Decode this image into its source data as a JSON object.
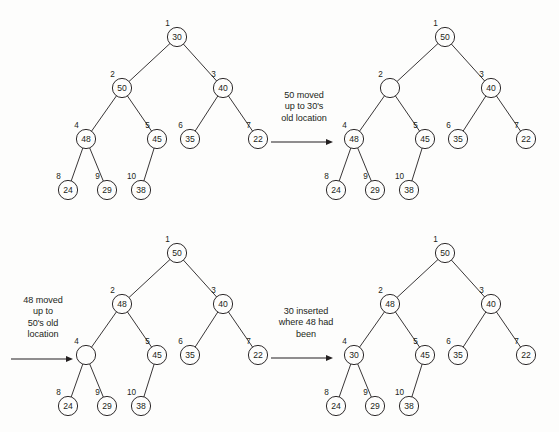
{
  "figure": {
    "background_color": "#fdfdfc",
    "ink_color": "#231f20"
  },
  "panels": [
    {
      "id": "panel-1",
      "name": "tree-before",
      "origin": {
        "x": 0,
        "y": 0
      },
      "nodes": [
        {
          "index": "1",
          "value": "30",
          "x": 177,
          "y": 37,
          "empty": false
        },
        {
          "index": "2",
          "value": "50",
          "x": 122,
          "y": 88,
          "empty": false
        },
        {
          "index": "3",
          "value": "40",
          "x": 223,
          "y": 88,
          "empty": false
        },
        {
          "index": "4",
          "value": "48",
          "x": 86,
          "y": 139,
          "empty": false
        },
        {
          "index": "5",
          "value": "45",
          "x": 157,
          "y": 139,
          "empty": false
        },
        {
          "index": "6",
          "value": "35",
          "x": 190,
          "y": 139,
          "empty": false
        },
        {
          "index": "7",
          "value": "22",
          "x": 258,
          "y": 139,
          "empty": false
        },
        {
          "index": "8",
          "value": "24",
          "x": 68,
          "y": 190,
          "empty": false
        },
        {
          "index": "9",
          "value": "29",
          "x": 107,
          "y": 190,
          "empty": false
        },
        {
          "index": "10",
          "value": "38",
          "x": 141,
          "y": 190,
          "empty": false
        }
      ],
      "edges": [
        [
          "1",
          "2"
        ],
        [
          "1",
          "3"
        ],
        [
          "2",
          "4"
        ],
        [
          "2",
          "5"
        ],
        [
          "3",
          "6"
        ],
        [
          "3",
          "7"
        ],
        [
          "4",
          "8"
        ],
        [
          "4",
          "9"
        ],
        [
          "5",
          "10"
        ]
      ]
    },
    {
      "id": "panel-2",
      "name": "tree-after-50-moved",
      "origin": {
        "x": 268,
        "y": 0
      },
      "nodes": [
        {
          "index": "1",
          "value": "50",
          "x": 445,
          "y": 37,
          "empty": false
        },
        {
          "index": "2",
          "value": "",
          "x": 390,
          "y": 88,
          "empty": true
        },
        {
          "index": "3",
          "value": "40",
          "x": 491,
          "y": 88,
          "empty": false
        },
        {
          "index": "4",
          "value": "48",
          "x": 354,
          "y": 139,
          "empty": false
        },
        {
          "index": "5",
          "value": "45",
          "x": 425,
          "y": 139,
          "empty": false
        },
        {
          "index": "6",
          "value": "35",
          "x": 458,
          "y": 139,
          "empty": false
        },
        {
          "index": "7",
          "value": "22",
          "x": 526,
          "y": 139,
          "empty": false
        },
        {
          "index": "8",
          "value": "24",
          "x": 336,
          "y": 190,
          "empty": false
        },
        {
          "index": "9",
          "value": "29",
          "x": 375,
          "y": 190,
          "empty": false
        },
        {
          "index": "10",
          "value": "38",
          "x": 409,
          "y": 190,
          "empty": false
        }
      ],
      "edges": [
        [
          "1",
          "2"
        ],
        [
          "1",
          "3"
        ],
        [
          "2",
          "4"
        ],
        [
          "2",
          "5"
        ],
        [
          "3",
          "6"
        ],
        [
          "3",
          "7"
        ],
        [
          "4",
          "8"
        ],
        [
          "4",
          "9"
        ],
        [
          "5",
          "10"
        ]
      ]
    },
    {
      "id": "panel-3",
      "name": "tree-after-48-moved",
      "origin": {
        "x": 0,
        "y": 216
      },
      "nodes": [
        {
          "index": "1",
          "value": "50",
          "x": 177,
          "y": 253,
          "empty": false
        },
        {
          "index": "2",
          "value": "48",
          "x": 122,
          "y": 304,
          "empty": false
        },
        {
          "index": "3",
          "value": "40",
          "x": 223,
          "y": 304,
          "empty": false
        },
        {
          "index": "4",
          "value": "",
          "x": 86,
          "y": 355,
          "empty": true
        },
        {
          "index": "5",
          "value": "45",
          "x": 157,
          "y": 355,
          "empty": false
        },
        {
          "index": "6",
          "value": "35",
          "x": 190,
          "y": 355,
          "empty": false
        },
        {
          "index": "7",
          "value": "22",
          "x": 258,
          "y": 355,
          "empty": false
        },
        {
          "index": "8",
          "value": "24",
          "x": 68,
          "y": 406,
          "empty": false
        },
        {
          "index": "9",
          "value": "29",
          "x": 107,
          "y": 406,
          "empty": false
        },
        {
          "index": "10",
          "value": "38",
          "x": 141,
          "y": 406,
          "empty": false
        }
      ],
      "edges": [
        [
          "1",
          "2"
        ],
        [
          "1",
          "3"
        ],
        [
          "2",
          "4"
        ],
        [
          "2",
          "5"
        ],
        [
          "3",
          "6"
        ],
        [
          "3",
          "7"
        ],
        [
          "4",
          "8"
        ],
        [
          "4",
          "9"
        ],
        [
          "5",
          "10"
        ]
      ]
    },
    {
      "id": "panel-4",
      "name": "tree-after-30-inserted",
      "origin": {
        "x": 268,
        "y": 216
      },
      "nodes": [
        {
          "index": "1",
          "value": "50",
          "x": 445,
          "y": 253,
          "empty": false
        },
        {
          "index": "2",
          "value": "48",
          "x": 390,
          "y": 304,
          "empty": false
        },
        {
          "index": "3",
          "value": "40",
          "x": 491,
          "y": 304,
          "empty": false
        },
        {
          "index": "4",
          "value": "30",
          "x": 354,
          "y": 355,
          "empty": false
        },
        {
          "index": "5",
          "value": "45",
          "x": 425,
          "y": 355,
          "empty": false
        },
        {
          "index": "6",
          "value": "35",
          "x": 458,
          "y": 355,
          "empty": false
        },
        {
          "index": "7",
          "value": "22",
          "x": 526,
          "y": 355,
          "empty": false
        },
        {
          "index": "8",
          "value": "24",
          "x": 336,
          "y": 406,
          "empty": false
        },
        {
          "index": "9",
          "value": "29",
          "x": 375,
          "y": 406,
          "empty": false
        },
        {
          "index": "10",
          "value": "38",
          "x": 409,
          "y": 406,
          "empty": false
        }
      ],
      "edges": [
        [
          "1",
          "2"
        ],
        [
          "1",
          "3"
        ],
        [
          "2",
          "4"
        ],
        [
          "2",
          "5"
        ],
        [
          "3",
          "6"
        ],
        [
          "3",
          "7"
        ],
        [
          "4",
          "8"
        ],
        [
          "4",
          "9"
        ],
        [
          "5",
          "10"
        ]
      ]
    }
  ],
  "annotations": [
    {
      "id": "annotation-1",
      "name": "caption-50-moved",
      "text": "50 moved\nup to 30's\nold location",
      "box": {
        "left": 268,
        "top": 90,
        "width": 72
      },
      "arrow": {
        "x1": 271,
        "y1": 142,
        "x2": 333,
        "y2": 142
      }
    },
    {
      "id": "annotation-2",
      "name": "caption-48-moved",
      "text": "48 moved\nup to\n50's old\nlocation",
      "box": {
        "left": 8,
        "top": 295,
        "width": 70
      },
      "arrow": {
        "x1": 11,
        "y1": 359,
        "x2": 73,
        "y2": 359
      }
    },
    {
      "id": "annotation-3",
      "name": "caption-30-inserted",
      "text": "30 inserted\nwhere 48 had\nbeen",
      "box": {
        "left": 268,
        "top": 306,
        "width": 76
      },
      "arrow": {
        "x1": 271,
        "y1": 358,
        "x2": 333,
        "y2": 358
      }
    }
  ],
  "geometry": {
    "node_radius": 9.6,
    "index_label_offset_y": -11.5,
    "index_label_offset_x": -9.5
  }
}
